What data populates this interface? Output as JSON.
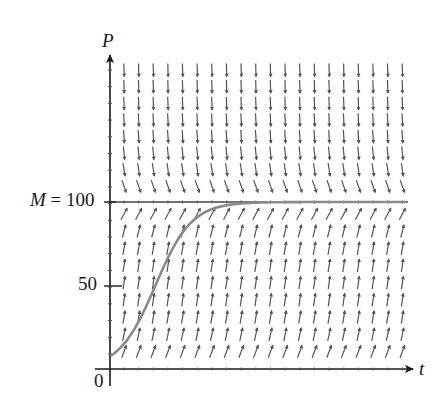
{
  "figure": {
    "type": "slope_field_with_solution",
    "equation_context": "logistic growth dP/dt = kP(1 - P/M)",
    "axes": {
      "x_label": "t",
      "y_label": "P",
      "origin_label": "0",
      "y_ticks": [
        {
          "value": 50,
          "label": "50"
        },
        {
          "value": 100,
          "label": "M = 100"
        }
      ]
    },
    "labels": {
      "P": "P",
      "t": "t",
      "M_prefix": "M",
      "M_equals": "= 100",
      "fifty": "50",
      "zero": "0"
    },
    "equilibrium_line": {
      "P": 100,
      "label": "M = 100"
    },
    "solution_curve": {
      "description": "logistic solution curve starting near P≈8 at t=0, rising sigmoidally to approach M=100",
      "initial_P": 8,
      "carrying_capacity": 100
    },
    "slope_field": {
      "columns": 20,
      "rows_above_M": 8,
      "rows_below_M": 9,
      "above_M_behavior": "steep negative slopes, flattening near M",
      "below_M_behavior": "steep positive slopes near P=50, flatter near 0 and M"
    },
    "colors": {
      "axis": "#1a1a1a",
      "segments": "#555555",
      "curve": "#8a8a8a",
      "background": "#ffffff"
    }
  }
}
